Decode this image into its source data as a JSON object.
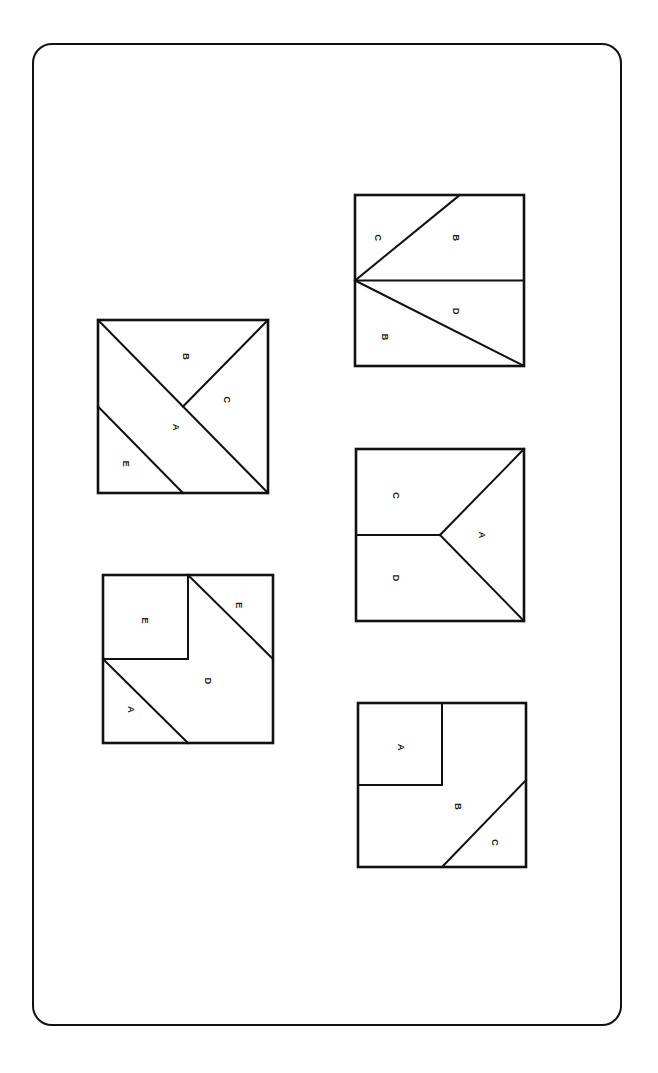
{
  "page": {
    "background_color": "#ffffff",
    "ink_color": "#111111",
    "border": {
      "name": "rounded-page-frame",
      "x": 32,
      "y": 43,
      "width": 590,
      "height": 983,
      "corner_radius": 20,
      "stroke_width": 2.5
    }
  },
  "figures": [
    {
      "id": "figure-top-right",
      "position": "top-right",
      "x": 352,
      "y": 192,
      "width": 169,
      "height": 171,
      "description": "Square divided by a horizontal midline from left edge to right edge, a diagonal from the left-edge midpoint up to the top-right corner, and a diagonal from the left-edge midpoint down to the bottom-right corner.",
      "regions": [
        {
          "label": "C",
          "lx": 0.14,
          "ly": 0.25
        },
        {
          "label": "B",
          "lx": 0.6,
          "ly": 0.25
        },
        {
          "label": "D",
          "lx": 0.6,
          "ly": 0.68
        },
        {
          "label": "B",
          "lx": 0.18,
          "ly": 0.83
        }
      ],
      "lines": [
        {
          "x1": 0.0,
          "y1": 0.5,
          "x2": 1.0,
          "y2": 0.5
        },
        {
          "x1": 0.0,
          "y1": 0.5,
          "x2": 0.62,
          "y2": 0.0
        },
        {
          "x1": 0.0,
          "y1": 0.5,
          "x2": 1.0,
          "y2": 1.0
        }
      ]
    },
    {
      "id": "figure-upper-left",
      "position": "upper-left",
      "x": 95,
      "y": 317,
      "width": 170,
      "height": 173,
      "description": "Square with a main diagonal from the top-left corner to the bottom-right corner, a line from the diagonal midpoint to the top-right corner, and a line from the left edge midpoint to the bottom edge midpoint.",
      "regions": [
        {
          "label": "B",
          "lx": 0.52,
          "ly": 0.21
        },
        {
          "label": "C",
          "lx": 0.76,
          "ly": 0.46
        },
        {
          "label": "A",
          "lx": 0.46,
          "ly": 0.62
        },
        {
          "label": "E",
          "lx": 0.17,
          "ly": 0.83
        }
      ],
      "lines": [
        {
          "x1": 0.0,
          "y1": 0.0,
          "x2": 1.0,
          "y2": 1.0
        },
        {
          "x1": 0.5,
          "y1": 0.5,
          "x2": 1.0,
          "y2": 0.0
        },
        {
          "x1": 0.0,
          "y1": 0.5,
          "x2": 0.5,
          "y2": 1.0
        }
      ]
    },
    {
      "id": "figure-middle-right",
      "position": "middle-right",
      "x": 353,
      "y": 446,
      "width": 168,
      "height": 172,
      "description": "Square with a horizontal line from the left edge midpoint to the centre, plus two diagonals from the centre to the top-right corner and to the bottom-right corner, forming an arrowhead.",
      "regions": [
        {
          "label": "C",
          "lx": 0.24,
          "ly": 0.27
        },
        {
          "label": "A",
          "lx": 0.75,
          "ly": 0.5
        },
        {
          "label": "D",
          "lx": 0.24,
          "ly": 0.75
        }
      ],
      "lines": [
        {
          "x1": 0.0,
          "y1": 0.5,
          "x2": 0.5,
          "y2": 0.5
        },
        {
          "x1": 0.5,
          "y1": 0.5,
          "x2": 1.0,
          "y2": 0.0
        },
        {
          "x1": 0.5,
          "y1": 0.5,
          "x2": 1.0,
          "y2": 1.0
        }
      ]
    },
    {
      "id": "figure-lower-left",
      "position": "lower-left",
      "x": 100,
      "y": 572,
      "width": 170,
      "height": 168,
      "description": "Square containing an inner square in the top-left quadrant, a diagonal from the top edge midpoint down to the right edge midpoint, and a diagonal from the left edge midpoint down to the bottom edge midpoint.",
      "regions": [
        {
          "label": "E",
          "lx": 0.25,
          "ly": 0.27
        },
        {
          "label": "E",
          "lx": 0.8,
          "ly": 0.18
        },
        {
          "label": "D",
          "lx": 0.62,
          "ly": 0.63
        },
        {
          "label": "A",
          "lx": 0.17,
          "ly": 0.8
        }
      ],
      "lines": [
        {
          "x1": 0.5,
          "y1": 0.0,
          "x2": 0.5,
          "y2": 0.5
        },
        {
          "x1": 0.0,
          "y1": 0.5,
          "x2": 0.5,
          "y2": 0.5
        },
        {
          "x1": 0.5,
          "y1": 0.0,
          "x2": 1.0,
          "y2": 0.5
        },
        {
          "x1": 0.0,
          "y1": 0.5,
          "x2": 0.5,
          "y2": 1.0
        }
      ]
    },
    {
      "id": "figure-bottom-right",
      "position": "bottom-right",
      "x": 355,
      "y": 700,
      "width": 168,
      "height": 164,
      "description": "Square containing an inner square in the top-left quadrant and a diagonal cutting off a triangle at the bottom-right corner.",
      "regions": [
        {
          "label": "A",
          "lx": 0.26,
          "ly": 0.27
        },
        {
          "label": "B",
          "lx": 0.6,
          "ly": 0.63
        },
        {
          "label": "C",
          "lx": 0.82,
          "ly": 0.85
        }
      ],
      "lines": [
        {
          "x1": 0.5,
          "y1": 0.0,
          "x2": 0.5,
          "y2": 0.5
        },
        {
          "x1": 0.0,
          "y1": 0.5,
          "x2": 0.5,
          "y2": 0.5
        },
        {
          "x1": 1.0,
          "y1": 0.47,
          "x2": 0.5,
          "y2": 1.0
        }
      ]
    }
  ]
}
